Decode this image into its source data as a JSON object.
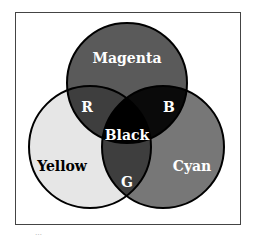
{
  "diagram": {
    "type": "venn-3",
    "circles": [
      {
        "id": "magenta",
        "label": "Magenta",
        "fill": "#5a5a5a"
      },
      {
        "id": "yellow",
        "label": "Yellow",
        "fill": "#e6e6e6"
      },
      {
        "id": "cyan",
        "label": "Cyan",
        "fill": "#777777"
      }
    ],
    "overlaps": {
      "magenta_yellow": {
        "label": "R",
        "fill": "#3e3e3e"
      },
      "magenta_cyan": {
        "label": "B",
        "fill": "#0a0a0a"
      },
      "yellow_cyan": {
        "label": "G",
        "fill": "#3e3e3e"
      },
      "center": {
        "label": "Black",
        "fill": "#000000"
      }
    },
    "caption": "…"
  }
}
